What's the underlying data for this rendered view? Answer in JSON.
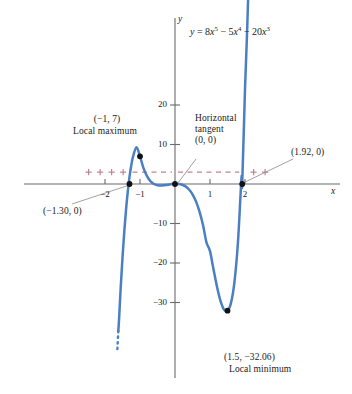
{
  "figure": {
    "equation_label": "y = 8x^5 - 5x^4 - 20x^3",
    "equation_parts": {
      "y": "y",
      "eq": " = 8",
      "x1": "x",
      "p1": "5",
      "m1": " − 5",
      "x2": "x",
      "p2": "4",
      "m2": " − 20",
      "x3": "x",
      "p3": "3"
    },
    "x_axis_name": "x",
    "y_axis_name": "y"
  },
  "annotations": {
    "local_max_point": "(−1, 7)",
    "local_max_text": "Local maximum",
    "horizontal_tangent_line1": "Horizontal",
    "horizontal_tangent_line2": "tangent",
    "horizontal_tangent_point": "(0, 0)",
    "zero_left": "(−1.30, 0)",
    "zero_right": "(1.92, 0)",
    "local_min_point": "(1.5, −32.06)",
    "local_min_text": "Local minimum"
  },
  "axes": {
    "x_ticks": [
      {
        "value": -2,
        "label": "−2"
      },
      {
        "value": -1,
        "label": "−1"
      },
      {
        "value": 1,
        "label": "1"
      },
      {
        "value": 2,
        "label": "2"
      }
    ],
    "y_ticks": [
      {
        "value": 20,
        "label": "20"
      },
      {
        "value": 10,
        "label": "10"
      },
      {
        "value": -10,
        "label": "−10"
      },
      {
        "value": -20,
        "label": "−20"
      },
      {
        "value": -30,
        "label": "−30"
      }
    ]
  },
  "colors": {
    "curve": "#4a7fc4",
    "axis": "#6b6b6b",
    "sign_marks": "#bf8292",
    "point": "#111111",
    "leader": "#8a8a8a",
    "text": "#1a1a1a"
  },
  "chart_data": {
    "type": "line",
    "title": "",
    "subtitle": "",
    "xlabel": "x",
    "ylabel": "y",
    "xlim": [
      -2.6,
      2.9
    ],
    "ylim": [
      -37,
      30
    ],
    "grid": false,
    "legend": "none",
    "function": "y = 8x^5 - 5x^4 - 20x^3",
    "series": [
      {
        "name": "y = 8x^5 - 5x^4 - 20x^3",
        "color": "#4a7fc4",
        "x": [
          -1.62,
          -1.6,
          -1.55,
          -1.5,
          -1.45,
          -1.4,
          -1.35,
          -1.3,
          -1.25,
          -1.2,
          -1.1,
          -1.0,
          -0.9,
          -0.8,
          -0.7,
          -0.6,
          -0.5,
          -0.4,
          -0.3,
          -0.2,
          -0.1,
          0.0,
          0.1,
          0.2,
          0.3,
          0.4,
          0.5,
          0.6,
          0.7,
          0.8,
          0.9,
          1.0,
          1.1,
          1.2,
          1.3,
          1.4,
          1.5,
          1.6,
          1.7,
          1.8,
          1.9,
          1.92,
          2.0,
          2.05,
          2.1
        ],
        "y": [
          -37.2,
          -34.5,
          -26.0,
          -18.6,
          -12.1,
          -6.6,
          -2.0,
          1.8,
          4.7,
          6.9,
          9.3,
          7.0,
          4.0,
          2.0,
          0.7,
          0.0,
          -0.3,
          -0.4,
          -0.3,
          -0.2,
          -0.02,
          0.0,
          -0.02,
          -0.2,
          -0.6,
          -1.4,
          -2.6,
          -4.4,
          -7.0,
          -10.4,
          -14.8,
          -17.0,
          -21.6,
          -26.0,
          -29.6,
          -31.8,
          -32.06,
          -30.1,
          -24.7,
          -14.6,
          1.6,
          0.0,
          24.0,
          36.0,
          50.0
        ]
      }
    ],
    "marked_points": [
      {
        "x": -1.3,
        "y": 0,
        "label": "(−1.30, 0)",
        "kind": "zero"
      },
      {
        "x": -1.0,
        "y": 7,
        "label": "(−1, 7)",
        "kind": "local-maximum"
      },
      {
        "x": 0.0,
        "y": 0,
        "label": "(0, 0)",
        "kind": "horizontal-tangent"
      },
      {
        "x": 1.5,
        "y": -32.06,
        "label": "(1.5, −32.06)",
        "kind": "local-minimum"
      },
      {
        "x": 1.92,
        "y": 0,
        "label": "(1.92, 0)",
        "kind": "zero"
      }
    ],
    "sign_chart": {
      "y_position": 3,
      "intervals": [
        {
          "from": -2.65,
          "to": -1.3,
          "sign": "+"
        },
        {
          "from": -1.3,
          "to": 0.0,
          "sign": "-"
        },
        {
          "from": 0.0,
          "to": 1.92,
          "sign": "-"
        },
        {
          "from": 1.92,
          "to": 2.9,
          "sign": "+"
        }
      ]
    }
  }
}
